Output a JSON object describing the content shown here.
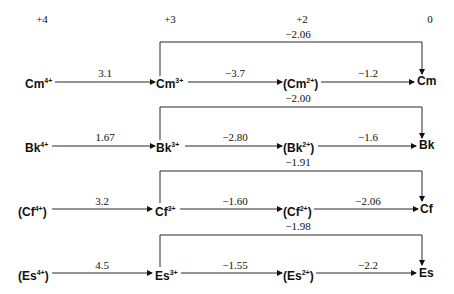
{
  "header": {
    "oxidation_states": [
      "+4",
      "+3",
      "+2",
      "0"
    ]
  },
  "rows": [
    {
      "element": "Cm",
      "species": [
        {
          "base": "Cm",
          "charge": "4+",
          "parenthesized": false
        },
        {
          "base": "Cm",
          "charge": "3+",
          "parenthesized": false
        },
        {
          "base": "Cm",
          "charge": "2+",
          "parenthesized": true
        },
        {
          "base": "Cm",
          "charge": "",
          "parenthesized": false
        }
      ],
      "potentials": [
        "3.1",
        "−3.7",
        "−1.2"
      ],
      "bracket_potential": "−2.06"
    },
    {
      "element": "Bk",
      "species": [
        {
          "base": "Bk",
          "charge": "4+",
          "parenthesized": false
        },
        {
          "base": "Bk",
          "charge": "3+",
          "parenthesized": false
        },
        {
          "base": "Bk",
          "charge": "2+",
          "parenthesized": true
        },
        {
          "base": "Bk",
          "charge": "",
          "parenthesized": false
        }
      ],
      "potentials": [
        "1.67",
        "−2.80",
        "−1.6"
      ],
      "bracket_potential": "−2.00"
    },
    {
      "element": "Cf",
      "species": [
        {
          "base": "Cf",
          "charge": "4+",
          "parenthesized": true
        },
        {
          "base": "Cf",
          "charge": "3+",
          "parenthesized": false
        },
        {
          "base": "Cf",
          "charge": "2+",
          "parenthesized": true
        },
        {
          "base": "Cf",
          "charge": "",
          "parenthesized": false
        }
      ],
      "potentials": [
        "3.2",
        "−1.60",
        "−2.06"
      ],
      "bracket_potential": "−1.91"
    },
    {
      "element": "Es",
      "species": [
        {
          "base": "Es",
          "charge": "4+",
          "parenthesized": true
        },
        {
          "base": "Es",
          "charge": "3+",
          "parenthesized": false
        },
        {
          "base": "Es",
          "charge": "2+",
          "parenthesized": true
        },
        {
          "base": "Es",
          "charge": "",
          "parenthesized": false
        }
      ],
      "potentials": [
        "4.5",
        "−1.55",
        "−2.2"
      ],
      "bracket_potential": "−1.98"
    }
  ],
  "labels": {
    "r0": {
      "s0_open": "",
      "s0_base": "Cm",
      "s0_sup": "4+",
      "s0_close": "",
      "s1_base": "Cm",
      "s1_sup": "3+",
      "s2_open": "(",
      "s2_base": "Cm",
      "s2_sup": "2+",
      "s2_close": ")",
      "s3_base": "Cm"
    },
    "r1": {
      "s0_open": "",
      "s0_base": "Bk",
      "s0_sup": "4+",
      "s0_close": "",
      "s1_base": "Bk",
      "s1_sup": "3+",
      "s2_open": "(",
      "s2_base": "Bk",
      "s2_sup": "2+",
      "s2_close": ")",
      "s3_base": "Bk"
    },
    "r2": {
      "s0_open": "(",
      "s0_base": "Cf",
      "s0_sup": "4+",
      "s0_close": ")",
      "s1_base": "Cf",
      "s1_sup": "3+",
      "s2_open": "(",
      "s2_base": "Cf",
      "s2_sup": "2+",
      "s2_close": ")",
      "s3_base": "Cf"
    },
    "r3": {
      "s0_open": "(",
      "s0_base": "Es",
      "s0_sup": "4+",
      "s0_close": ")",
      "s1_base": "Es",
      "s1_sup": "3+",
      "s2_open": "(",
      "s2_base": "Es",
      "s2_sup": "2+",
      "s2_close": ")",
      "s3_base": "Es"
    }
  }
}
